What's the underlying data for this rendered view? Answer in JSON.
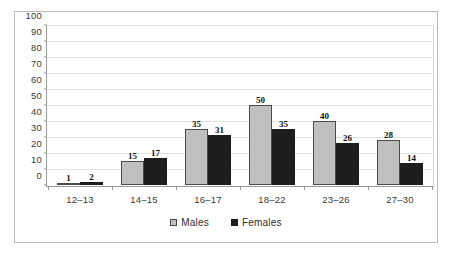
{
  "chart_data": {
    "type": "bar",
    "title": "",
    "subtitle": "",
    "xlabel": "",
    "ylabel": "",
    "categories": [
      "12–13",
      "14–15",
      "16–17",
      "18–22",
      "23–26",
      "27–30"
    ],
    "series": [
      {
        "name": "Males",
        "color": "#bfbfbf",
        "values": [
          1,
          15,
          35,
          50,
          40,
          28
        ]
      },
      {
        "name": "Females",
        "color": "#1d1d1d",
        "values": [
          2,
          17,
          31,
          35,
          26,
          14
        ]
      }
    ],
    "ylim": [
      0,
      100
    ],
    "ytick_values": [
      0,
      10,
      20,
      30,
      40,
      50,
      60,
      70,
      80,
      90,
      100
    ],
    "ytick_labels": [
      "0",
      "10",
      "20",
      "30",
      "40",
      "50",
      "60",
      "70",
      "80",
      "90",
      "100"
    ],
    "grid": true,
    "grid_axis": "y",
    "legend": [
      "Males",
      "Females"
    ],
    "legend_position": "bottom-center",
    "bar_labels_shown": true,
    "frame_border_color": "#bcbcbc",
    "axis_color": "#9a9a9a",
    "gridline_color": "#e3e3e3",
    "background_color": "#ffffff"
  }
}
